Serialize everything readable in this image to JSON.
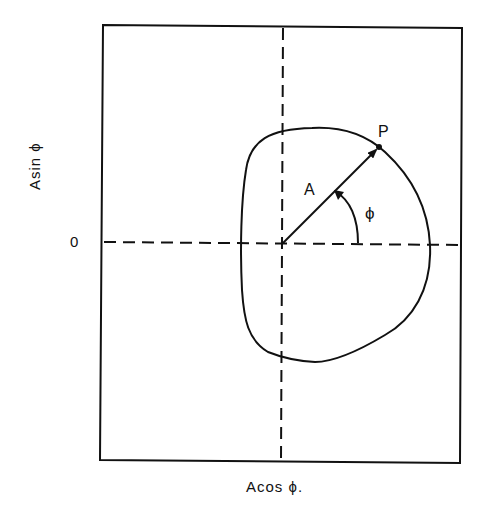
{
  "diagram": {
    "title": "",
    "y_axis_label": "Asin ϕ",
    "x_axis_label": "Acos ϕ.",
    "origin_tick_label": "0",
    "vector_label": "A",
    "point_label": "P",
    "angle_label": "ϕ",
    "elements": {
      "frame": {
        "x": 102,
        "y": 25,
        "width": 360,
        "height": 438
      },
      "vertical_dashed_axis_x": 283,
      "horizontal_dashed_axis_y": 243,
      "origin": [
        283,
        243
      ],
      "point_P": [
        379,
        147
      ],
      "closed_curve_bounds": {
        "xmin": 240,
        "xmax": 430,
        "ymin": 128,
        "ymax": 362
      }
    },
    "colors": {
      "line": "#111111",
      "background": "#ffffff"
    }
  }
}
